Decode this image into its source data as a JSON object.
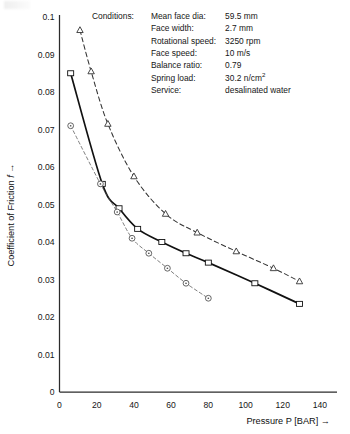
{
  "conditions": {
    "heading": "Conditions:",
    "rows": [
      {
        "label": "Mean face dia:",
        "value": "59.5 mm"
      },
      {
        "label": "Face width:",
        "value": "2.7 mm"
      },
      {
        "label": "Rotational speed:",
        "value": "3250 rpm"
      },
      {
        "label": "Face speed:",
        "value": "10 m/s"
      },
      {
        "label": "Balance ratio:",
        "value": "0.79"
      },
      {
        "label": "Spring load:",
        "value": "30.2 n/cm",
        "sup": "2"
      },
      {
        "label": "Service:",
        "value": "desalinated water"
      }
    ]
  },
  "chart_data": {
    "type": "line",
    "title": "",
    "xlabel": "Pressure P [BAR] →",
    "ylabel": "Coefficient of Friction  f →",
    "xlim": [
      0,
      147
    ],
    "ylim": [
      0,
      0.1
    ],
    "grid": false,
    "legend": "none",
    "xticks": [
      0,
      20,
      40,
      60,
      80,
      100,
      120,
      140
    ],
    "xticklabels": [
      "0",
      "20",
      "40",
      "60",
      "80",
      "100",
      "120",
      "140"
    ],
    "yticks": [
      0,
      0.01,
      0.02,
      0.03,
      0.04,
      0.05,
      0.06,
      0.07,
      0.08,
      0.09,
      0.1
    ],
    "yticklabels": [
      "0",
      "0.01",
      "0.02",
      "0.03",
      "0.04",
      "0.05",
      "0.06",
      "0.07",
      "0.08",
      "0.09",
      "0.1"
    ],
    "series": [
      {
        "name": "triangle-curve",
        "marker": "triangle",
        "linestyle": "dashed",
        "color": "#333333",
        "x": [
          11,
          17,
          26,
          40,
          57,
          74,
          95,
          115,
          129
        ],
        "y": [
          0.0965,
          0.0855,
          0.0715,
          0.0575,
          0.0475,
          0.0425,
          0.0375,
          0.033,
          0.0295
        ]
      },
      {
        "name": "square-curve",
        "marker": "square",
        "linestyle": "solid",
        "color": "#111111",
        "x": [
          6,
          23,
          32,
          42,
          55,
          68,
          80,
          105,
          129
        ],
        "y": [
          0.085,
          0.0555,
          0.049,
          0.0435,
          0.04,
          0.037,
          0.0345,
          0.029,
          0.0235
        ]
      },
      {
        "name": "circle-curve",
        "marker": "circle",
        "linestyle": "dashed-thin",
        "color": "#555555",
        "x": [
          6,
          22,
          31,
          39,
          48,
          58,
          68,
          80
        ],
        "y": [
          0.071,
          0.0555,
          0.048,
          0.041,
          0.037,
          0.033,
          0.029,
          0.025
        ]
      }
    ]
  }
}
